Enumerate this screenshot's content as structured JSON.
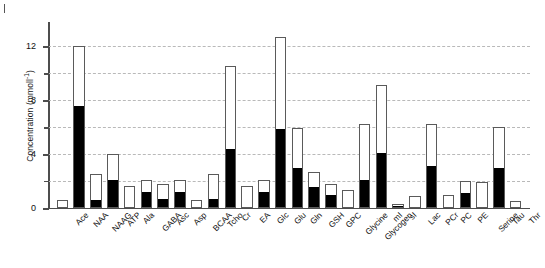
{
  "figure": {
    "panel_mark": "|",
    "ylabel_text": "Concentration (mmoll",
    "ylabel_exponent": "-1",
    "ylabel_close": ")"
  },
  "chart_data": {
    "type": "bar",
    "title": "",
    "xlabel": "",
    "ylabel": "Concentration (mmoll-1)",
    "ylim": [
      0,
      13.8
    ],
    "yticks_major": [
      0,
      4,
      8,
      12
    ],
    "yticks_minor": [
      2,
      6,
      10
    ],
    "ytick_labels": [
      "0",
      "4",
      "8",
      "12"
    ],
    "grid": true,
    "legend": "none",
    "stacked": true,
    "categories": [
      "Ace",
      "NAA",
      "NAAG",
      "ATP",
      "Ala",
      "GABA",
      "Asc",
      "Asp",
      "BCAA",
      "Tcho",
      "Cr",
      "EA",
      "Glc",
      "Glu",
      "Gln",
      "GSH",
      "GPC",
      "Glycine",
      "Glycogen",
      "mI",
      "sI",
      "Lac",
      "PCr",
      "PC",
      "PE",
      "Serine",
      "Tau",
      "Thr"
    ],
    "series": [
      {
        "name": "lower segment (filled black)",
        "color": "#000000",
        "values": [
          0.0,
          7.6,
          0.6,
          2.1,
          0.0,
          1.2,
          0.7,
          1.2,
          0.0,
          0.7,
          4.4,
          0.0,
          1.2,
          5.9,
          3.0,
          1.6,
          1.0,
          0.0,
          2.1,
          4.1,
          0.15,
          0.0,
          3.1,
          0.0,
          1.1,
          0.0,
          3.0,
          0.0
        ]
      },
      {
        "name": "upper segment (open white)",
        "color": "#ffffff",
        "values": [
          0.6,
          4.4,
          1.9,
          1.9,
          1.6,
          0.9,
          1.1,
          0.9,
          0.6,
          1.8,
          6.1,
          1.6,
          0.9,
          6.8,
          2.9,
          1.1,
          0.8,
          1.3,
          4.1,
          5.0,
          0.15,
          0.9,
          3.1,
          1.0,
          0.9,
          1.9,
          3.0,
          0.5
        ]
      }
    ],
    "totals": [
      0.6,
      12.0,
      2.5,
      4.0,
      1.6,
      2.1,
      1.8,
      2.1,
      0.6,
      2.5,
      10.5,
      1.6,
      2.1,
      12.7,
      5.9,
      2.7,
      1.8,
      1.3,
      6.2,
      9.1,
      0.3,
      0.9,
      6.2,
      1.0,
      2.0,
      1.9,
      6.0,
      0.5
    ]
  }
}
